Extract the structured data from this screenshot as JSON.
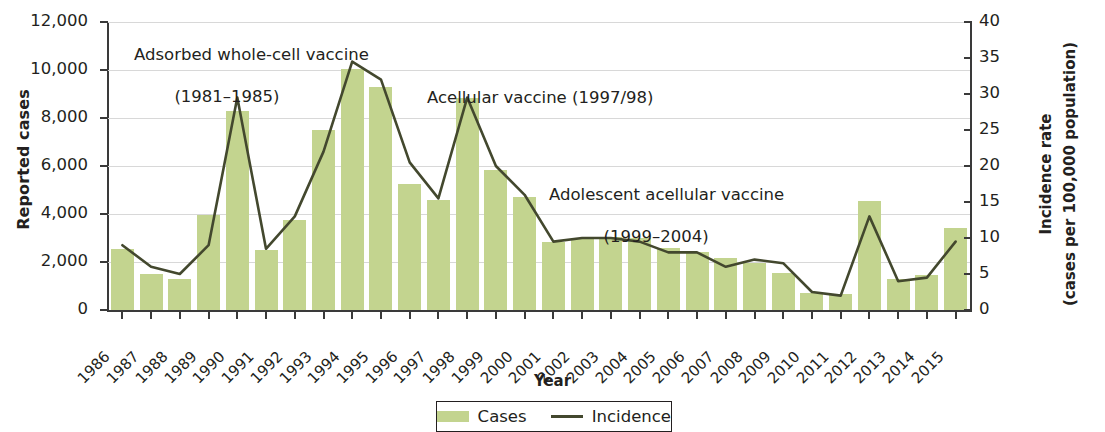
{
  "axes": {
    "y_left_title": "Reported cases",
    "y_right_title_line1": "Incidence rate",
    "y_right_title_line2": "(cases per 100,000 population)",
    "x_title": "Year"
  },
  "legend": {
    "cases_label": "Cases",
    "incidence_label": "Incidence",
    "cases_color": "#c3d48f",
    "incidence_color": "#43482e"
  },
  "annotations": [
    {
      "line1": "Adsorbed whole-cell vaccine",
      "line2": "(1981–1985)"
    },
    {
      "line1": "Acellular vaccine (1997/98)",
      "line2": ""
    },
    {
      "line1": "Adolescent acellular vaccine",
      "line2": "(1999–2004)"
    }
  ],
  "chart_data": {
    "type": "bar",
    "title": "",
    "xlabel": "Year",
    "ylabel": "Reported cases",
    "y2label": "Incidence rate (cases per 100,000 population)",
    "ylim": [
      0,
      12000
    ],
    "y2lim": [
      0,
      40
    ],
    "yticks": [
      "0",
      "2,000",
      "4,000",
      "6,000",
      "8,000",
      "10,000",
      "12,000"
    ],
    "ytick_values": [
      0,
      2000,
      4000,
      6000,
      8000,
      10000,
      12000
    ],
    "y2ticks": [
      "0",
      "5",
      "10",
      "15",
      "20",
      "25",
      "30",
      "35",
      "40"
    ],
    "y2tick_values": [
      0,
      5,
      10,
      15,
      20,
      25,
      30,
      35,
      40
    ],
    "grid": true,
    "legend_position": "bottom",
    "categories": [
      "1986",
      "1987",
      "1988",
      "1989",
      "1990",
      "1991",
      "1992",
      "1993",
      "1994",
      "1995",
      "1996",
      "1997",
      "1998",
      "1999",
      "2000",
      "2001",
      "2002",
      "2003",
      "2004",
      "2005",
      "2006",
      "2007",
      "2008",
      "2009",
      "2010",
      "2011",
      "2012",
      "2013",
      "2014",
      "2015"
    ],
    "series": [
      {
        "name": "Cases",
        "axis": "left",
        "type": "bar",
        "color": "#c3d48f",
        "values": [
          2550,
          1500,
          1300,
          3950,
          8300,
          2500,
          3750,
          7500,
          10050,
          9300,
          5250,
          4600,
          8850,
          5850,
          4700,
          2850,
          3000,
          3050,
          3000,
          2600,
          2400,
          2150,
          1950,
          1550,
          700,
          650,
          4550,
          1300,
          1450,
          3400
        ]
      },
      {
        "name": "Incidence",
        "axis": "right",
        "type": "line",
        "color": "#43482e",
        "values": [
          9.0,
          6.0,
          5.0,
          9.0,
          29.5,
          8.5,
          13.0,
          22.0,
          34.5,
          32.0,
          20.5,
          15.5,
          29.5,
          20.0,
          16.0,
          9.5,
          10.0,
          10.0,
          9.5,
          8.0,
          8.0,
          6.0,
          7.0,
          6.5,
          2.5,
          2.0,
          13.0,
          4.0,
          4.5,
          9.5
        ]
      }
    ]
  }
}
